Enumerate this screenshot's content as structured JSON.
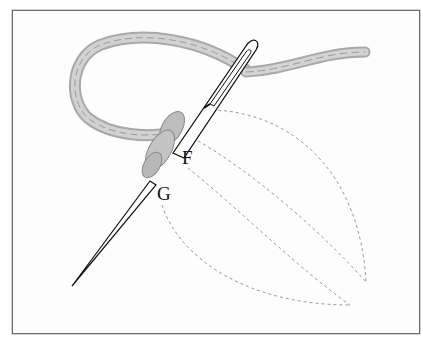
{
  "figure": {
    "type": "embroidery-stitch-illustration",
    "labels": {
      "point_f": "F",
      "point_g": "G"
    },
    "elements": [
      "frame",
      "thread",
      "needle",
      "knot-wrap",
      "leaf-outline-dashed"
    ],
    "colors": {
      "frame": "#6f6f6f",
      "thread": "#bdbdbd",
      "thread_dark": "#8a8a8a",
      "needle_outline": "#111111",
      "dashed_outline": "#9a9a9a",
      "background": "#fdfdfd"
    }
  }
}
